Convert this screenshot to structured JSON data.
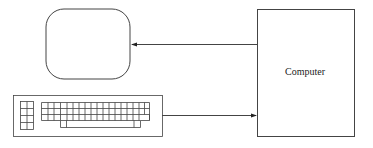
{
  "diagram": {
    "nodes": [
      {
        "id": "monitor",
        "label": "",
        "shape": "rounded-rectangle",
        "icon": "monitor-icon"
      },
      {
        "id": "keyboard",
        "label": "",
        "shape": "keyboard",
        "icon": "keyboard-icon"
      },
      {
        "id": "computer",
        "label": "Computer",
        "shape": "rectangle"
      }
    ],
    "edges": [
      {
        "from": "computer",
        "to": "monitor",
        "style": "arrow"
      },
      {
        "from": "keyboard",
        "to": "computer",
        "style": "arrow"
      }
    ],
    "colors": {
      "stroke": "#333333",
      "background": "#ffffff"
    }
  },
  "computer": {
    "label": "Computer"
  }
}
